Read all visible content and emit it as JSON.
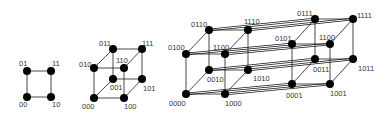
{
  "diagram": {
    "colors": {
      "node": "#000000",
      "edge": "#1a1a1a",
      "label": "#333333",
      "background": "#ffffff"
    },
    "square": {
      "nodes": [
        {
          "id": "00",
          "x": 27,
          "y": 97,
          "lx": 19,
          "ly": 107
        },
        {
          "id": "01",
          "x": 27,
          "y": 71,
          "lx": 19,
          "ly": 66
        },
        {
          "id": "10",
          "x": 51,
          "y": 97,
          "lx": 52,
          "ly": 107
        },
        {
          "id": "11",
          "x": 51,
          "y": 71,
          "lx": 52,
          "ly": 66
        }
      ],
      "edges": [
        [
          "00",
          "01"
        ],
        [
          "00",
          "10"
        ],
        [
          "01",
          "11"
        ],
        [
          "10",
          "11"
        ]
      ]
    },
    "cube": {
      "nodes": [
        {
          "id": "000",
          "x": 94,
          "y": 98,
          "lx": 82,
          "ly": 109
        },
        {
          "id": "100",
          "x": 124,
          "y": 98,
          "lx": 124,
          "ly": 109
        },
        {
          "id": "010",
          "x": 94,
          "y": 68,
          "lx": 79,
          "ly": 67
        },
        {
          "id": "110",
          "x": 124,
          "y": 68,
          "lx": 116,
          "ly": 63
        },
        {
          "id": "001",
          "x": 113,
          "y": 79,
          "lx": 110,
          "ly": 90
        },
        {
          "id": "101",
          "x": 142,
          "y": 79,
          "lx": 143,
          "ly": 91
        },
        {
          "id": "011",
          "x": 113,
          "y": 49,
          "lx": 99,
          "ly": 46
        },
        {
          "id": "111",
          "x": 142,
          "y": 49,
          "lx": 142,
          "ly": 46
        }
      ],
      "edges": [
        [
          "000",
          "100"
        ],
        [
          "000",
          "010"
        ],
        [
          "100",
          "110"
        ],
        [
          "010",
          "110"
        ],
        [
          "001",
          "101"
        ],
        [
          "001",
          "011"
        ],
        [
          "101",
          "111"
        ],
        [
          "011",
          "111"
        ],
        [
          "000",
          "001"
        ],
        [
          "100",
          "101"
        ],
        [
          "010",
          "011"
        ],
        [
          "110",
          "111"
        ]
      ]
    },
    "tesseract": {
      "nodes": [
        {
          "id": "0000",
          "x": 186,
          "y": 94,
          "lx": 169,
          "ly": 106
        },
        {
          "id": "1000",
          "x": 225,
          "y": 94,
          "lx": 225,
          "ly": 106
        },
        {
          "id": "0100",
          "x": 186,
          "y": 54,
          "lx": 168,
          "ly": 50
        },
        {
          "id": "1100",
          "x": 225,
          "y": 54,
          "lx": 213,
          "ly": 50
        },
        {
          "id": "0010",
          "x": 209,
          "y": 70,
          "lx": 207,
          "ly": 82
        },
        {
          "id": "1010",
          "x": 248,
          "y": 70,
          "lx": 253,
          "ly": 81
        },
        {
          "id": "0110",
          "x": 209,
          "y": 30,
          "lx": 191,
          "ly": 27
        },
        {
          "id": "1110",
          "x": 248,
          "y": 30,
          "lx": 244,
          "ly": 24
        },
        {
          "id": "0001",
          "x": 292,
          "y": 84,
          "lx": 286,
          "ly": 98
        },
        {
          "id": "1001",
          "x": 330,
          "y": 84,
          "lx": 330,
          "ly": 96
        },
        {
          "id": "0101",
          "x": 292,
          "y": 44,
          "lx": 275,
          "ly": 41
        },
        {
          "id": "1101",
          "x": 330,
          "y": 44,
          "lx": 319,
          "ly": 40
        },
        {
          "id": "0011",
          "x": 315,
          "y": 59,
          "lx": 313,
          "ly": 72
        },
        {
          "id": "1011",
          "x": 353,
          "y": 59,
          "lx": 358,
          "ly": 71
        },
        {
          "id": "0111",
          "x": 315,
          "y": 19,
          "lx": 297,
          "ly": 16
        },
        {
          "id": "1111",
          "x": 353,
          "y": 19,
          "lx": 357,
          "ly": 18
        }
      ],
      "label_overrides": {
        "1101": "1100"
      },
      "edges": [
        [
          "0000",
          "1000"
        ],
        [
          "0000",
          "0100"
        ],
        [
          "1000",
          "1100"
        ],
        [
          "0100",
          "1100"
        ],
        [
          "0010",
          "1010"
        ],
        [
          "0010",
          "0110"
        ],
        [
          "1010",
          "1110"
        ],
        [
          "0110",
          "1110"
        ],
        [
          "0000",
          "0010"
        ],
        [
          "1000",
          "1010"
        ],
        [
          "0100",
          "0110"
        ],
        [
          "1100",
          "1110"
        ],
        [
          "0001",
          "1001"
        ],
        [
          "0001",
          "0101"
        ],
        [
          "1001",
          "1101"
        ],
        [
          "0101",
          "1101"
        ],
        [
          "0011",
          "1011"
        ],
        [
          "0011",
          "0111"
        ],
        [
          "1011",
          "1111"
        ],
        [
          "0111",
          "1111"
        ],
        [
          "0001",
          "0011"
        ],
        [
          "1001",
          "1011"
        ],
        [
          "0101",
          "0111"
        ],
        [
          "1101",
          "1111"
        ]
      ],
      "bridge_edges": [
        [
          "0000",
          "0001"
        ],
        [
          "1000",
          "1001"
        ],
        [
          "0100",
          "0101"
        ],
        [
          "1100",
          "1101"
        ],
        [
          "0010",
          "0011"
        ],
        [
          "1010",
          "1011"
        ],
        [
          "0110",
          "0111"
        ],
        [
          "1110",
          "1111"
        ]
      ]
    }
  }
}
